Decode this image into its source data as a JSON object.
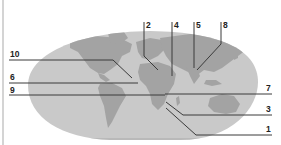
{
  "diagram": {
    "type": "world-map-labeled",
    "colors": {
      "background": "#ffffff",
      "ocean": "#c9c9c9",
      "land": "#a3a3a3",
      "leader_line": "#3a3a3a",
      "label_text": "#222222",
      "left_rule": "#d4d4d4"
    },
    "labels": [
      {
        "id": "label-1",
        "text": "1"
      },
      {
        "id": "label-2",
        "text": "2"
      },
      {
        "id": "label-3",
        "text": "3"
      },
      {
        "id": "label-4",
        "text": "4"
      },
      {
        "id": "label-5",
        "text": "5"
      },
      {
        "id": "label-6",
        "text": "6"
      },
      {
        "id": "label-7",
        "text": "7"
      },
      {
        "id": "label-8",
        "text": "8"
      },
      {
        "id": "label-9",
        "text": "9"
      },
      {
        "id": "label-10",
        "text": "10"
      }
    ]
  }
}
